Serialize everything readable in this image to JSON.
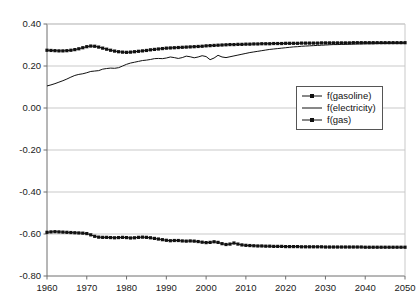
{
  "chart_data": {
    "type": "line",
    "title": "",
    "subtitle": "",
    "xlabel": "",
    "ylabel": "",
    "xlim": [
      1960,
      2050
    ],
    "ylim": [
      -0.8,
      0.4
    ],
    "grid": true,
    "legend_position": "center-right",
    "xticks": [
      "1960",
      "1970",
      "1980",
      "1990",
      "2000",
      "2010",
      "2020",
      "2030",
      "2040",
      "2050"
    ],
    "yticks": [
      "0.40",
      "0.20",
      "0.00",
      "-0.20",
      "-0.40",
      "-0.60",
      "-0.80"
    ],
    "xtick_values": [
      1960,
      1970,
      1980,
      1990,
      2000,
      2010,
      2020,
      2030,
      2040,
      2050
    ],
    "ytick_values": [
      0.4,
      0.2,
      0.0,
      -0.2,
      -0.4,
      -0.6,
      -0.8
    ],
    "x": [
      1960,
      1961,
      1962,
      1963,
      1964,
      1965,
      1966,
      1967,
      1968,
      1969,
      1970,
      1971,
      1972,
      1973,
      1974,
      1975,
      1976,
      1977,
      1978,
      1979,
      1980,
      1981,
      1982,
      1983,
      1984,
      1985,
      1986,
      1987,
      1988,
      1989,
      1990,
      1991,
      1992,
      1993,
      1994,
      1995,
      1996,
      1997,
      1998,
      1999,
      2000,
      2001,
      2002,
      2003,
      2004,
      2005,
      2006,
      2007,
      2008,
      2009,
      2010,
      2011,
      2012,
      2013,
      2014,
      2015,
      2016,
      2017,
      2018,
      2019,
      2020,
      2021,
      2022,
      2023,
      2024,
      2025,
      2026,
      2027,
      2028,
      2029,
      2030,
      2031,
      2032,
      2033,
      2034,
      2035,
      2036,
      2037,
      2038,
      2039,
      2040,
      2041,
      2042,
      2043,
      2044,
      2045,
      2046,
      2047,
      2048,
      2049,
      2050
    ],
    "series": [
      {
        "name": "f(gasoline)",
        "marker": "square",
        "color": "#111111",
        "values": [
          0.275,
          0.274,
          0.273,
          0.272,
          0.272,
          0.273,
          0.275,
          0.278,
          0.282,
          0.287,
          0.292,
          0.295,
          0.294,
          0.29,
          0.285,
          0.28,
          0.275,
          0.271,
          0.268,
          0.266,
          0.265,
          0.266,
          0.268,
          0.27,
          0.272,
          0.274,
          0.277,
          0.279,
          0.281,
          0.283,
          0.285,
          0.286,
          0.287,
          0.288,
          0.289,
          0.29,
          0.291,
          0.292,
          0.293,
          0.294,
          0.296,
          0.297,
          0.298,
          0.299,
          0.3,
          0.301,
          0.302,
          0.302,
          0.303,
          0.303,
          0.304,
          0.304,
          0.305,
          0.305,
          0.306,
          0.306,
          0.306,
          0.307,
          0.307,
          0.307,
          0.308,
          0.308,
          0.308,
          0.308,
          0.309,
          0.309,
          0.309,
          0.309,
          0.309,
          0.31,
          0.31,
          0.31,
          0.31,
          0.31,
          0.31,
          0.31,
          0.31,
          0.311,
          0.311,
          0.311,
          0.311,
          0.311,
          0.311,
          0.311,
          0.311,
          0.311,
          0.311,
          0.311,
          0.311,
          0.311,
          0.311
        ]
      },
      {
        "name": "f(electricity)",
        "marker": "none",
        "color": "#111111",
        "values": [
          0.105,
          0.11,
          0.116,
          0.123,
          0.13,
          0.138,
          0.147,
          0.155,
          0.16,
          0.163,
          0.168,
          0.174,
          0.176,
          0.178,
          0.185,
          0.188,
          0.19,
          0.189,
          0.192,
          0.2,
          0.208,
          0.214,
          0.218,
          0.222,
          0.226,
          0.228,
          0.231,
          0.235,
          0.236,
          0.235,
          0.238,
          0.243,
          0.24,
          0.236,
          0.24,
          0.247,
          0.244,
          0.239,
          0.243,
          0.249,
          0.245,
          0.23,
          0.238,
          0.251,
          0.243,
          0.24,
          0.244,
          0.248,
          0.252,
          0.256,
          0.26,
          0.264,
          0.267,
          0.27,
          0.273,
          0.276,
          0.279,
          0.281,
          0.283,
          0.285,
          0.287,
          0.289,
          0.291,
          0.292,
          0.294,
          0.295,
          0.296,
          0.297,
          0.298,
          0.299,
          0.3,
          0.301,
          0.302,
          0.302,
          0.303,
          0.303,
          0.304,
          0.304,
          0.305,
          0.305,
          0.306,
          0.306,
          0.306,
          0.307,
          0.307,
          0.307,
          0.308,
          0.308,
          0.308,
          0.308,
          0.309
        ]
      },
      {
        "name": "f(gas)",
        "marker": "square",
        "color": "#111111",
        "values": [
          -0.592,
          -0.59,
          -0.589,
          -0.59,
          -0.591,
          -0.592,
          -0.593,
          -0.594,
          -0.595,
          -0.596,
          -0.598,
          -0.604,
          -0.611,
          -0.615,
          -0.616,
          -0.616,
          -0.617,
          -0.618,
          -0.617,
          -0.616,
          -0.617,
          -0.619,
          -0.618,
          -0.616,
          -0.615,
          -0.616,
          -0.618,
          -0.621,
          -0.624,
          -0.627,
          -0.63,
          -0.632,
          -0.631,
          -0.631,
          -0.633,
          -0.634,
          -0.633,
          -0.634,
          -0.636,
          -0.639,
          -0.641,
          -0.64,
          -0.637,
          -0.64,
          -0.646,
          -0.65,
          -0.648,
          -0.643,
          -0.648,
          -0.652,
          -0.654,
          -0.655,
          -0.656,
          -0.657,
          -0.657,
          -0.658,
          -0.658,
          -0.659,
          -0.659,
          -0.659,
          -0.66,
          -0.66,
          -0.66,
          -0.66,
          -0.661,
          -0.661,
          -0.661,
          -0.661,
          -0.661,
          -0.661,
          -0.662,
          -0.662,
          -0.662,
          -0.662,
          -0.662,
          -0.662,
          -0.662,
          -0.662,
          -0.662,
          -0.662,
          -0.663,
          -0.663,
          -0.663,
          -0.663,
          -0.663,
          -0.663,
          -0.663,
          -0.663,
          -0.663,
          -0.663,
          -0.663
        ]
      }
    ]
  },
  "legend": {
    "items": [
      {
        "label": "f(gasoline)",
        "marker": "square"
      },
      {
        "label": "f(electricity)",
        "marker": "none"
      },
      {
        "label": "f(gas)",
        "marker": "square"
      }
    ]
  },
  "colors": {
    "axis": "#6f6f6f",
    "grid": "#c9c9c9",
    "series": "#111111",
    "legend_border": "#555555",
    "text": "#1a1a1a",
    "background": "#ffffff"
  }
}
